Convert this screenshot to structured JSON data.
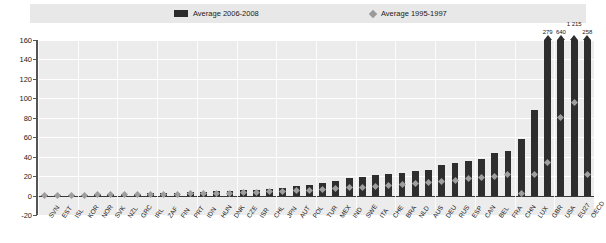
{
  "legend": {
    "series_bar_label": "Average 2006-2008",
    "series_diamond_label": "Average 1995-1997",
    "bar_color": "#2e2e2e",
    "diamond_color": "#9e9e9e"
  },
  "axis": {
    "y_ticks": [
      "160",
      "140",
      "120",
      "100",
      "80",
      "60",
      "40",
      "20",
      "0",
      "-20"
    ]
  },
  "chart_data": {
    "type": "bar",
    "title": "",
    "subtitle": "",
    "xlabel": "",
    "ylabel": "",
    "ylim": [
      -20,
      160
    ],
    "grid": true,
    "legend_position": "top",
    "categories": [
      "SVN",
      "EST",
      "ISL",
      "KOR",
      "NOR",
      "SVK",
      "NZL",
      "GRC",
      "IRL",
      "ZAF",
      "FIN",
      "PRT",
      "IDN",
      "HUN",
      "DNK",
      "CZE",
      "ISR",
      "CHL",
      "JPN",
      "AUT",
      "POL",
      "TUR",
      "MEX",
      "IND",
      "SWE",
      "ITA",
      "CHE",
      "BRA",
      "NLD",
      "AUS",
      "DEU",
      "RUS",
      "ESP",
      "CAN",
      "BEL",
      "FRA",
      "CHN",
      "LUX",
      "GBR",
      "USA",
      "EU27",
      "OECD"
    ],
    "series": [
      {
        "name": "Average 2006-2008",
        "values": [
          0.4,
          0.6,
          0.8,
          1.0,
          1.2,
          1.4,
          1.7,
          2.0,
          2.3,
          2.6,
          3.0,
          3.4,
          3.8,
          4.3,
          4.8,
          5.4,
          6.0,
          6.7,
          7.5,
          9.5,
          11.0,
          13.0,
          15.0,
          18.0,
          19.5,
          21.0,
          22.0,
          23.0,
          25.0,
          26.5,
          31.0,
          33.0,
          36.0,
          38.0,
          44.0,
          46.0,
          58.0,
          88.0,
          279.0,
          640.0,
          1215.0,
          258.0
        ]
      },
      {
        "name": "Average 1995-1997",
        "values": [
          0.2,
          0.3,
          0.4,
          0.5,
          0.6,
          0.7,
          0.8,
          1.0,
          1.2,
          1.4,
          1.6,
          1.8,
          2.0,
          2.3,
          2.6,
          3.0,
          3.4,
          3.8,
          4.3,
          5.0,
          5.6,
          6.3,
          7.0,
          7.8,
          8.6,
          9.4,
          10.3,
          11.2,
          12.2,
          13.2,
          14.5,
          15.8,
          17.2,
          18.6,
          20.0,
          22.0,
          2.0,
          22.0,
          34.0,
          80.0,
          96.0,
          22.0
        ]
      }
    ],
    "clipped_bar_labels": [
      {
        "category": "GBR",
        "label": "279"
      },
      {
        "category": "USA",
        "label": "640"
      },
      {
        "category": "EU27",
        "label": "1 215"
      },
      {
        "category": "OECD",
        "label": "258"
      }
    ]
  }
}
